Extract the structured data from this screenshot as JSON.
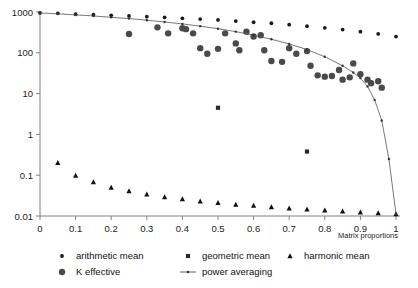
{
  "chart_data": {
    "type": "scatter",
    "title": "",
    "xlabel": "Matrix proportions",
    "ylabel": "",
    "xlim": [
      0,
      1
    ],
    "ylim": [
      0.01,
      1000
    ],
    "yscale": "log",
    "grid": false,
    "legend_position": "bottom",
    "xticks": [
      "0",
      "0.1",
      "0.2",
      "0.3",
      "0.4",
      "0.5",
      "0.6",
      "0.7",
      "0.8",
      "0.9",
      "1"
    ],
    "yticks": [
      "1000",
      "100",
      "10",
      "1",
      "0.1",
      "0.01"
    ],
    "series": [
      {
        "name": "arithmetic mean",
        "marker": "small-dot",
        "points": [
          [
            0.0,
            950
          ],
          [
            0.05,
            930
          ],
          [
            0.1,
            880
          ],
          [
            0.15,
            860
          ],
          [
            0.2,
            830
          ],
          [
            0.25,
            800
          ],
          [
            0.3,
            770
          ],
          [
            0.35,
            740
          ],
          [
            0.4,
            700
          ],
          [
            0.45,
            670
          ],
          [
            0.5,
            640
          ],
          [
            0.55,
            600
          ],
          [
            0.6,
            560
          ],
          [
            0.65,
            530
          ],
          [
            0.7,
            490
          ],
          [
            0.75,
            450
          ],
          [
            0.8,
            410
          ],
          [
            0.85,
            370
          ],
          [
            0.9,
            330
          ],
          [
            0.95,
            290
          ],
          [
            1.0,
            250
          ]
        ]
      },
      {
        "name": "geometric mean",
        "marker": "square",
        "points": [
          [
            0.5,
            4.5
          ],
          [
            0.75,
            0.38
          ]
        ]
      },
      {
        "name": "harmonic mean",
        "marker": "triangle",
        "points": [
          [
            0.05,
            0.2
          ],
          [
            0.1,
            0.098
          ],
          [
            0.15,
            0.068
          ],
          [
            0.2,
            0.05
          ],
          [
            0.25,
            0.041
          ],
          [
            0.3,
            0.034
          ],
          [
            0.35,
            0.029
          ],
          [
            0.4,
            0.026
          ],
          [
            0.45,
            0.023
          ],
          [
            0.5,
            0.021
          ],
          [
            0.55,
            0.019
          ],
          [
            0.6,
            0.018
          ],
          [
            0.65,
            0.0165
          ],
          [
            0.7,
            0.0155
          ],
          [
            0.75,
            0.0145
          ],
          [
            0.8,
            0.0138
          ],
          [
            0.85,
            0.013
          ],
          [
            0.9,
            0.0124
          ],
          [
            0.95,
            0.0118
          ],
          [
            1.0,
            0.0112
          ]
        ]
      },
      {
        "name": "K effective",
        "marker": "circle",
        "points": [
          [
            0.25,
            290
          ],
          [
            0.33,
            420
          ],
          [
            0.36,
            300
          ],
          [
            0.4,
            400
          ],
          [
            0.41,
            380
          ],
          [
            0.43,
            300
          ],
          [
            0.45,
            130
          ],
          [
            0.47,
            95
          ],
          [
            0.5,
            125
          ],
          [
            0.52,
            300
          ],
          [
            0.55,
            170
          ],
          [
            0.56,
            115
          ],
          [
            0.58,
            330
          ],
          [
            0.6,
            250
          ],
          [
            0.62,
            270
          ],
          [
            0.63,
            115
          ],
          [
            0.65,
            63
          ],
          [
            0.68,
            60
          ],
          [
            0.7,
            130
          ],
          [
            0.72,
            95
          ],
          [
            0.75,
            110
          ],
          [
            0.76,
            48
          ],
          [
            0.78,
            28
          ],
          [
            0.8,
            26
          ],
          [
            0.82,
            27
          ],
          [
            0.84,
            38
          ],
          [
            0.85,
            22
          ],
          [
            0.87,
            25
          ],
          [
            0.88,
            55
          ],
          [
            0.9,
            30
          ],
          [
            0.92,
            22
          ],
          [
            0.93,
            18
          ],
          [
            0.95,
            20
          ],
          [
            0.96,
            14
          ]
        ]
      },
      {
        "name": "power averaging",
        "marker": "line-with-dots",
        "points": [
          [
            0.0,
            950
          ],
          [
            0.05,
            900
          ],
          [
            0.1,
            850
          ],
          [
            0.15,
            800
          ],
          [
            0.2,
            740
          ],
          [
            0.25,
            690
          ],
          [
            0.3,
            630
          ],
          [
            0.35,
            570
          ],
          [
            0.4,
            510
          ],
          [
            0.45,
            450
          ],
          [
            0.5,
            390
          ],
          [
            0.55,
            330
          ],
          [
            0.6,
            270
          ],
          [
            0.65,
            215
          ],
          [
            0.7,
            165
          ],
          [
            0.75,
            120
          ],
          [
            0.8,
            80
          ],
          [
            0.85,
            48
          ],
          [
            0.88,
            33
          ],
          [
            0.9,
            24
          ],
          [
            0.92,
            15
          ],
          [
            0.94,
            7.0
          ],
          [
            0.96,
            2.2
          ],
          [
            0.98,
            0.25
          ],
          [
            1.0,
            0.0112
          ]
        ]
      }
    ]
  },
  "legend": {
    "items": [
      {
        "label": "arithmetic mean",
        "marker": "small-dot"
      },
      {
        "label": "geometric mean",
        "marker": "square"
      },
      {
        "label": "harmonic mean",
        "marker": "triangle"
      },
      {
        "label": "K effective",
        "marker": "circle"
      },
      {
        "label": "power averaging",
        "marker": "line"
      }
    ]
  },
  "colors": {
    "marker": "#1a1a1a",
    "k_effective": "#555555",
    "axis": "#808080",
    "curve": "#555555",
    "background": "#ffffff"
  }
}
